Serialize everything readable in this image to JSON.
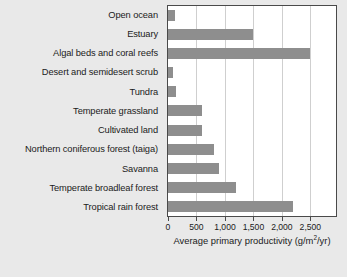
{
  "chart_data": {
    "type": "bar",
    "orientation": "horizontal",
    "title": "",
    "xlabel": "Average primary productivity (g/m2/yr)",
    "xlabel_parts": {
      "main": "Average primary productivity (g/m",
      "sup": "2",
      "tail": "/yr)"
    },
    "ylabel": "",
    "categories": [
      "Open ocean",
      "Estuary",
      "Algal beds and coral reefs",
      "Desert and semidesert scrub",
      "Tundra",
      "Temperate grassland",
      "Cultivated land",
      "Northern coniferous forest (taiga)",
      "Savanna",
      "Temperate broadleaf forest",
      "Tropical rain forest"
    ],
    "values": [
      125,
      1500,
      2500,
      90,
      140,
      600,
      600,
      800,
      900,
      1200,
      2200
    ],
    "xlim": [
      0,
      2950
    ],
    "xticks": [
      0,
      500,
      1000,
      1500,
      2000,
      2500
    ],
    "xtick_labels": [
      "0",
      "500",
      "1,000",
      "1,500",
      "2,000",
      "2,500"
    ],
    "grid": true,
    "grid_axis": "x",
    "legend": "none",
    "bar_color": "#8e8e8e",
    "plot_bg": "#ffffff",
    "figure_bg": "#e9e9e9",
    "axis_color": "#4a4a4a",
    "gridline_color": "#cfcfcf"
  }
}
